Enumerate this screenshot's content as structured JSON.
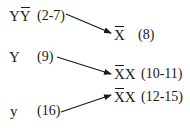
{
  "nodes": [
    {
      "id": "yybar",
      "prefix": "Y",
      "barred": "Y",
      "suffix": "",
      "label": "(2-7)"
    },
    {
      "id": "xbar",
      "prefix": "",
      "barred": "X",
      "suffix": "",
      "label": "(8)"
    },
    {
      "id": "Y",
      "prefix": "Y",
      "barred": "",
      "suffix": "",
      "label": "(9)"
    },
    {
      "id": "xbarx1",
      "prefix": "",
      "barred": "X",
      "suffix": "X",
      "label": "(10-11)"
    },
    {
      "id": "xbarx2",
      "prefix": "",
      "barred": "X",
      "suffix": "X",
      "label": "(12-15)"
    },
    {
      "id": "y",
      "prefix": "y",
      "barred": "",
      "suffix": "",
      "label": "(16)"
    }
  ],
  "edges": [
    {
      "from": "yybar",
      "to": "xbar"
    },
    {
      "from": "Y",
      "to": "xbarx1"
    },
    {
      "from": "y",
      "to": "xbarx2"
    }
  ]
}
